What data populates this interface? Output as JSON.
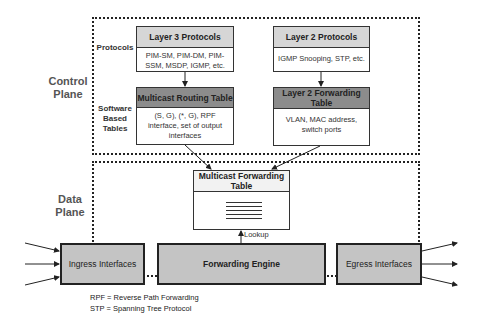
{
  "planes": {
    "control": "Control Plane",
    "data": "Data Plane"
  },
  "row_labels": {
    "protocols": "Protocols",
    "software_tables": "Software Based Tables"
  },
  "control_plane": {
    "layer3_protocols": {
      "title": "Layer 3 Protocols",
      "body": "PIM-SM, PIM-DM, PIM-SSM, MSDP, IGMP, etc."
    },
    "multicast_routing_table": {
      "title": "Multicast Routing Table",
      "body": "(S, G), (*, G), RPF interface, set of output interfaces"
    },
    "layer2_protocols": {
      "title": "Layer 2 Protocols",
      "body": "IGMP Snooping, STP, etc."
    },
    "layer2_forwarding_table": {
      "title": "Layer 2 Forwarding Table",
      "body": "VLAN, MAC address, switch ports"
    }
  },
  "data_plane": {
    "multicast_forwarding_table": {
      "title": "Multicast Forwarding Table"
    },
    "lookup_label": "Lookup",
    "ingress": "Ingress Interfaces",
    "forwarding_engine": "Forwarding Engine",
    "egress": "Egress Interfaces"
  },
  "legend": [
    "RPF = Reverse Path Forwarding",
    "STP = Spanning Tree Protocol"
  ],
  "colors": {
    "header_light": "#d6d6d6",
    "header_dark": "#8c8c8c",
    "hardware_fill": "#c4c4c4"
  }
}
